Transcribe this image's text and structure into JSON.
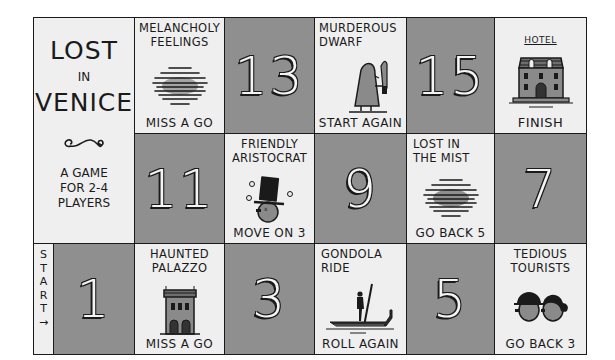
{
  "game": {
    "title_line1": "LOST",
    "title_line2": "IN",
    "title_line3": "VENICE",
    "subtitle_line1": "A GAME",
    "subtitle_line2": "FOR 2-4",
    "subtitle_line3": "PLAYERS",
    "ornament_icon": "swirl-ornament-icon",
    "start_label": [
      "S",
      "T",
      "A",
      "R",
      "T",
      "→"
    ]
  },
  "colors": {
    "light_square": "#efefef",
    "dark_square": "#8f8f8f",
    "ink": "#1a1a1a"
  },
  "squares": [
    {
      "number": "1",
      "type": "numbered"
    },
    {
      "title": "HAUNTED PALAZZO",
      "action": "MISS A GO",
      "icon": "palazzo-icon",
      "square_index": 2
    },
    {
      "number": "3",
      "type": "numbered"
    },
    {
      "title": "GONDOLA RIDE",
      "action": "ROLL AGAIN",
      "icon": "gondola-icon",
      "square_index": 4
    },
    {
      "number": "5",
      "type": "numbered"
    },
    {
      "title": "TEDIOUS TOURISTS",
      "action": "GO BACK 3",
      "icon": "tourists-icon",
      "square_index": 6
    },
    {
      "number": "7",
      "type": "numbered"
    },
    {
      "title": "LOST IN THE MIST",
      "action": "GO BACK 5",
      "icon": "mist-icon",
      "square_index": 8
    },
    {
      "number": "9",
      "type": "numbered"
    },
    {
      "title": "FRIENDLY ARISTOCRAT",
      "action": "MOVE ON 3",
      "icon": "aristocrat-icon",
      "square_index": 10
    },
    {
      "number": "11",
      "type": "numbered"
    },
    {
      "title": "MELANCHOLY FEELINGS",
      "action": "MISS A GO",
      "icon": "scribble-cloud-icon",
      "square_index": 12
    },
    {
      "number": "13",
      "type": "numbered"
    },
    {
      "title": "MURDEROUS DWARF",
      "action": "START AGAIN",
      "icon": "dwarf-with-knife-icon",
      "square_index": 14
    },
    {
      "number": "15",
      "type": "numbered"
    },
    {
      "title": "HOTEL",
      "action": "FINISH",
      "icon": "hotel-icon",
      "square_index": 16
    }
  ]
}
